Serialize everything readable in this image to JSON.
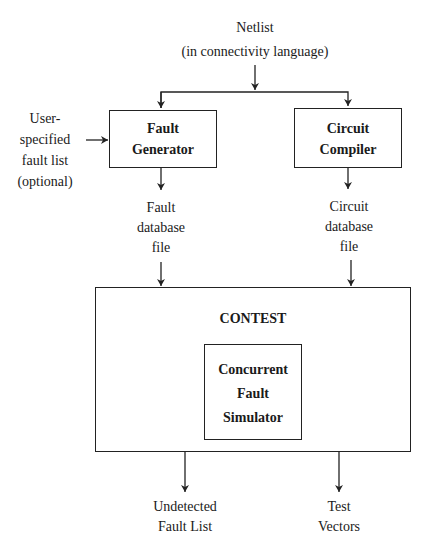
{
  "diagram": {
    "type": "flowchart",
    "inputs": {
      "netlist": [
        "Netlist",
        "(in connectivity language)"
      ],
      "user_fault_list": [
        "User-",
        "specified",
        "fault list",
        "(optional)"
      ]
    },
    "blocks": {
      "fault_generator": [
        "Fault",
        "Generator"
      ],
      "circuit_compiler": [
        "Circuit",
        "Compiler"
      ],
      "contest": "CONTEST",
      "simulator": [
        "Concurrent",
        "Fault",
        "Simulator"
      ]
    },
    "intermediate": {
      "fault_db": [
        "Fault",
        "database",
        "file"
      ],
      "circuit_db": [
        "Circuit",
        "database",
        "file"
      ]
    },
    "outputs": {
      "undetected": [
        "Undetected",
        "Fault List"
      ],
      "vectors": [
        "Test",
        "Vectors"
      ]
    },
    "edges": [
      [
        "Netlist",
        "Fault Generator"
      ],
      [
        "Netlist",
        "Circuit Compiler"
      ],
      [
        "User-specified fault list",
        "Fault Generator"
      ],
      [
        "Fault Generator",
        "Fault database file"
      ],
      [
        "Circuit Compiler",
        "Circuit database file"
      ],
      [
        "Fault database file",
        "CONTEST"
      ],
      [
        "Circuit database file",
        "CONTEST"
      ],
      [
        "CONTEST",
        "Undetected Fault List"
      ],
      [
        "CONTEST",
        "Test Vectors"
      ]
    ]
  }
}
